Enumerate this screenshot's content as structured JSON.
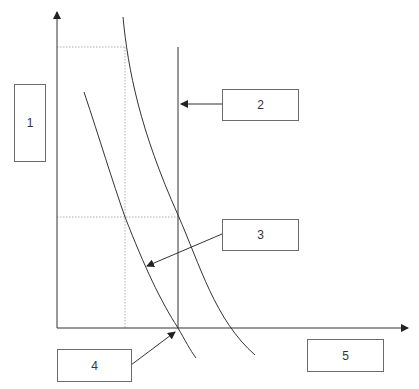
{
  "diagram": {
    "type": "economics-style axis diagram with two downward-sloping curves and a vertical line",
    "labels": {
      "box1": "1",
      "box2": "2",
      "box3": "3",
      "box4": "4",
      "box5": "5"
    },
    "colors": {
      "line": "#333333",
      "dotted": "#999999",
      "box_border": "#6b6b6b"
    }
  }
}
